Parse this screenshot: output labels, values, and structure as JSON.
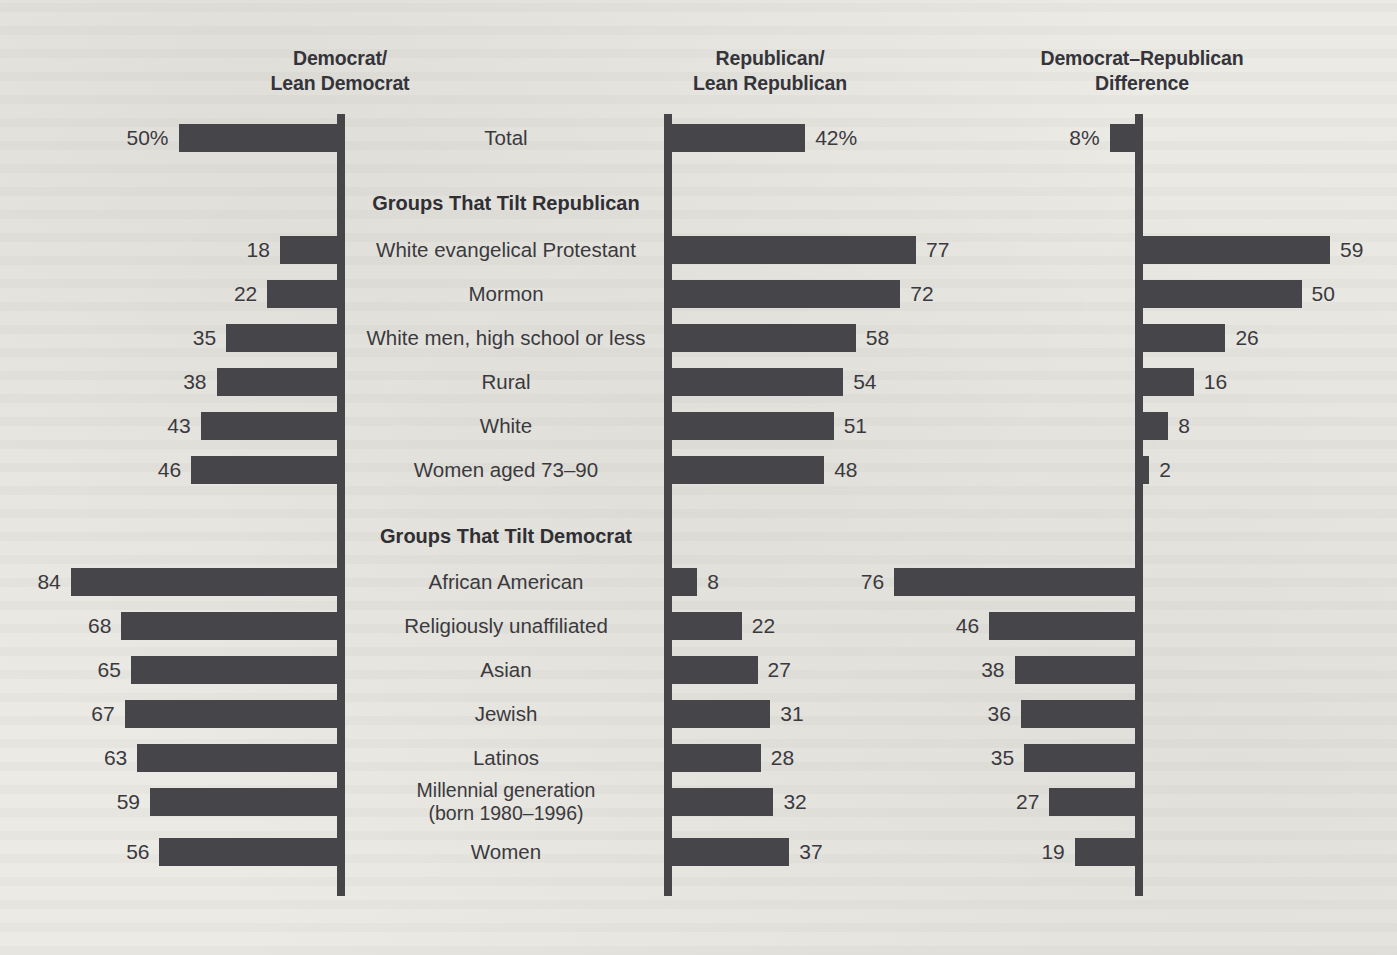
{
  "headers": {
    "democrat": {
      "line1": "Democrat/",
      "line2": "Lean Democrat"
    },
    "republican": {
      "line1": "Republican/",
      "line2": "Lean Republican"
    },
    "difference": {
      "line1": "Democrat–Republican",
      "line2": "Difference"
    }
  },
  "sections": {
    "tilt_republican": "Groups That Tilt Republican",
    "tilt_democrat": "Groups That Tilt Democrat"
  },
  "chart_data": {
    "type": "bar",
    "subtitle": "",
    "xlabel": "",
    "ylabel": "",
    "orientation": "horizontal",
    "layout": "three-panel diverging / butterfly",
    "grid": false,
    "legend": "none",
    "axis_scale_px_per_unit": 3.17,
    "xlim": [
      0,
      90
    ],
    "panels": [
      {
        "key": "democrat",
        "title": "Democrat/Lean Democrat",
        "direction": "left"
      },
      {
        "key": "republican",
        "title": "Republican/Lean Republican",
        "direction": "right"
      },
      {
        "key": "difference",
        "title": "Democrat–Republican Difference",
        "direction": "signed"
      }
    ],
    "series": [
      {
        "name": "Democrat/Lean Democrat",
        "values": [
          50,
          18,
          22,
          35,
          38,
          43,
          46,
          84,
          68,
          65,
          67,
          63,
          59,
          56
        ]
      },
      {
        "name": "Republican/Lean Republican",
        "values": [
          42,
          77,
          72,
          58,
          54,
          51,
          48,
          8,
          22,
          27,
          31,
          28,
          32,
          37
        ]
      },
      {
        "name": "Democrat–Republican Difference",
        "values": [
          8,
          59,
          50,
          26,
          16,
          8,
          2,
          76,
          46,
          38,
          36,
          35,
          27,
          19
        ]
      }
    ],
    "categories": [
      "Total",
      "White evangelical Protestant",
      "Mormon",
      "White men, high school or less",
      "Rural",
      "White",
      "Women aged 73–90",
      "African American",
      "Religiously unaffiliated",
      "Asian",
      "Jewish",
      "Latinos",
      "Millennial generation (born 1980–1996)",
      "Women"
    ],
    "rows": [
      {
        "id": "total",
        "label": "Total",
        "label_line2": "",
        "group": "total",
        "y": 116,
        "dem": 50,
        "dem_text": "50%",
        "rep": 42,
        "rep_text": "42%",
        "diff": 8,
        "diff_text": "8%",
        "diff_dir": "left"
      },
      {
        "id": "white-evangelical-protestant",
        "label": "White evangelical Protestant",
        "label_line2": "",
        "group": "tilt_republican",
        "y": 228,
        "dem": 18,
        "dem_text": "18",
        "rep": 77,
        "rep_text": "77",
        "diff": 59,
        "diff_text": "59",
        "diff_dir": "right"
      },
      {
        "id": "mormon",
        "label": "Mormon",
        "label_line2": "",
        "group": "tilt_republican",
        "y": 272,
        "dem": 22,
        "dem_text": "22",
        "rep": 72,
        "rep_text": "72",
        "diff": 50,
        "diff_text": "50",
        "diff_dir": "right"
      },
      {
        "id": "white-men-high-school-or-less",
        "label": "White men, high school or less",
        "label_line2": "",
        "group": "tilt_republican",
        "y": 316,
        "dem": 35,
        "dem_text": "35",
        "rep": 58,
        "rep_text": "58",
        "diff": 26,
        "diff_text": "26",
        "diff_dir": "right"
      },
      {
        "id": "rural",
        "label": "Rural",
        "label_line2": "",
        "group": "tilt_republican",
        "y": 360,
        "dem": 38,
        "dem_text": "38",
        "rep": 54,
        "rep_text": "54",
        "diff": 16,
        "diff_text": "16",
        "diff_dir": "right"
      },
      {
        "id": "white",
        "label": "White",
        "label_line2": "",
        "group": "tilt_republican",
        "y": 404,
        "dem": 43,
        "dem_text": "43",
        "rep": 51,
        "rep_text": "51",
        "diff": 8,
        "diff_text": "8",
        "diff_dir": "right"
      },
      {
        "id": "women-aged-73-90",
        "label": "Women aged 73–90",
        "label_line2": "",
        "group": "tilt_republican",
        "y": 448,
        "dem": 46,
        "dem_text": "46",
        "rep": 48,
        "rep_text": "48",
        "diff": 2,
        "diff_text": "2",
        "diff_dir": "right"
      },
      {
        "id": "african-american",
        "label": "African American",
        "label_line2": "",
        "group": "tilt_democrat",
        "y": 560,
        "dem": 84,
        "dem_text": "84",
        "rep": 8,
        "rep_text": "8",
        "diff": 76,
        "diff_text": "76",
        "diff_dir": "left"
      },
      {
        "id": "religiously-unaffiliated",
        "label": "Religiously unaffiliated",
        "label_line2": "",
        "group": "tilt_democrat",
        "y": 604,
        "dem": 68,
        "dem_text": "68",
        "rep": 22,
        "rep_text": "22",
        "diff": 46,
        "diff_text": "46",
        "diff_dir": "left"
      },
      {
        "id": "asian",
        "label": "Asian",
        "label_line2": "",
        "group": "tilt_democrat",
        "y": 648,
        "dem": 65,
        "dem_text": "65",
        "rep": 27,
        "rep_text": "27",
        "diff": 38,
        "diff_text": "38",
        "diff_dir": "left"
      },
      {
        "id": "jewish",
        "label": "Jewish",
        "label_line2": "",
        "group": "tilt_democrat",
        "y": 692,
        "dem": 67,
        "dem_text": "67",
        "rep": 31,
        "rep_text": "31",
        "diff": 36,
        "diff_text": "36",
        "diff_dir": "left"
      },
      {
        "id": "latinos",
        "label": "Latinos",
        "label_line2": "",
        "group": "tilt_democrat",
        "y": 736,
        "dem": 63,
        "dem_text": "63",
        "rep": 28,
        "rep_text": "28",
        "diff": 35,
        "diff_text": "35",
        "diff_dir": "left"
      },
      {
        "id": "millennial-generation",
        "label": "Millennial generation",
        "label_line2": "(born 1980–1996)",
        "group": "tilt_democrat",
        "y": 780,
        "dem": 59,
        "dem_text": "59",
        "rep": 32,
        "rep_text": "32",
        "diff": 27,
        "diff_text": "27",
        "diff_dir": "left"
      },
      {
        "id": "women",
        "label": "Women",
        "label_line2": "",
        "group": "tilt_democrat",
        "y": 830,
        "dem": 56,
        "dem_text": "56",
        "rep": 37,
        "rep_text": "37",
        "diff": 19,
        "diff_text": "19",
        "diff_dir": "left"
      }
    ]
  },
  "colors": {
    "bar": "#46464a",
    "axis": "#46464a",
    "text": "#3a3a3e",
    "heading": "#2f2f34",
    "background": "#eceae5"
  }
}
